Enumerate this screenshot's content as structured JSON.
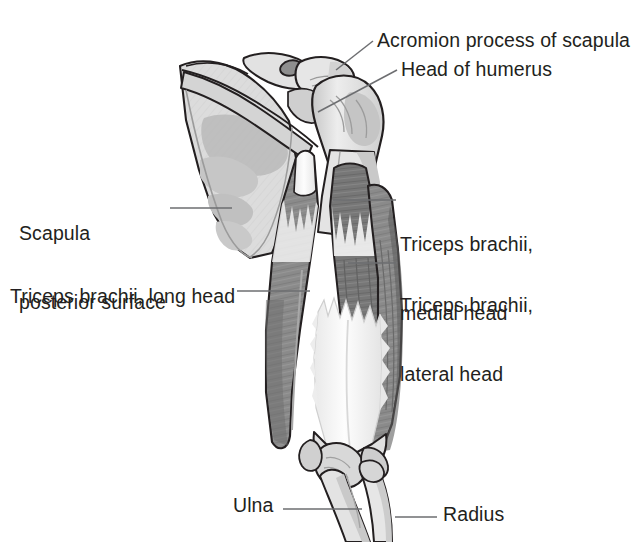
{
  "figure": {
    "background_color": "#ffffff",
    "text_color": "#231f20",
    "leader_line_color": "#6d6e71",
    "outline_color": "#231f20",
    "bone_fill": "#dcdcdc",
    "bone_shadow": "#c2c2c2",
    "muscle_fill": "#8a8a8a",
    "muscle_dark": "#6f6f6f",
    "tendon_fill": "#fbfbfb",
    "width": 640,
    "height": 542
  },
  "labels": {
    "acromion": "Acromion process of scapula",
    "head_of_humerus": "Head of humerus",
    "scapula_line1": "Scapula",
    "scapula_line2": "posterior surface",
    "triceps_medial_line1": "Triceps brachii,",
    "triceps_medial_line2": "medial head",
    "triceps_lateral_line1": "Triceps brachii,",
    "triceps_lateral_line2": "lateral head",
    "triceps_long": "Triceps brachii, long head",
    "ulna": "Ulna",
    "radius": "Radius"
  },
  "structures": [
    {
      "name": "scapula",
      "label": "Scapula posterior surface"
    },
    {
      "name": "acromion-process",
      "label": "Acromion process of scapula"
    },
    {
      "name": "head-of-humerus",
      "label": "Head of humerus"
    },
    {
      "name": "humerus-shaft",
      "label": "Humerus"
    },
    {
      "name": "triceps-long-head",
      "label": "Triceps brachii, long head"
    },
    {
      "name": "triceps-medial-head",
      "label": "Triceps brachii, medial head"
    },
    {
      "name": "triceps-lateral-head",
      "label": "Triceps brachii, lateral head"
    },
    {
      "name": "triceps-tendon",
      "label": "Triceps tendon (aponeurosis)"
    },
    {
      "name": "olecranon",
      "label": "Olecranon"
    },
    {
      "name": "ulna",
      "label": "Ulna"
    },
    {
      "name": "radius",
      "label": "Radius"
    }
  ]
}
